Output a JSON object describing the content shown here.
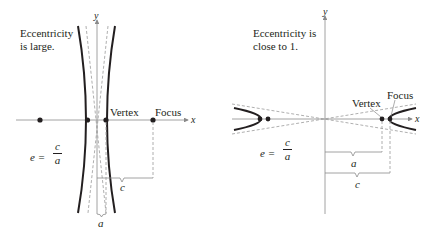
{
  "left_panel": {
    "caption_line1": "Eccentricity",
    "caption_line2": "is large.",
    "axis_x": "x",
    "axis_y": "y",
    "vertex_label": "Vertex",
    "focus_label": "Focus",
    "formula_lhs": "e =",
    "formula_num": "c",
    "formula_den": "a",
    "brace_a": "a",
    "brace_c": "c"
  },
  "right_panel": {
    "caption_line1": "Eccentricity is",
    "caption_line2": "close to 1.",
    "axis_x": "x",
    "axis_y": "y",
    "vertex_label": "Vertex",
    "focus_label": "Focus",
    "formula_lhs": "e =",
    "formula_num": "c",
    "formula_den": "a",
    "brace_a": "a",
    "brace_c": "c"
  },
  "colors": {
    "curve": "#231f20",
    "axis": "#8a8a8a",
    "dashed": "#9a9a9a"
  }
}
